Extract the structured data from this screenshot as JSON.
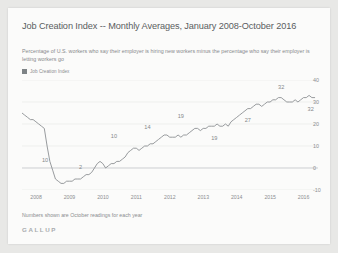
{
  "chart_data": {
    "type": "line",
    "title": "Job Creation Index -- Monthly Averages, January 2008-October 2016",
    "subtitle": "Percentage of U.S. workers who say their employer is hiring new workers minus the percentage who say their employer is letting workers go",
    "xlabel": "",
    "ylabel": "",
    "ylim": [
      -10,
      40
    ],
    "yticks": [
      40,
      30,
      20,
      10,
      0,
      -10
    ],
    "xticks": [
      "2008",
      "2009",
      "2010",
      "2011",
      "2012",
      "2013",
      "2014",
      "2015",
      "2016"
    ],
    "grid": true,
    "legend": {
      "position": "top-left",
      "entries": [
        "Job Creation Index"
      ]
    },
    "series": [
      {
        "name": "Job Creation Index",
        "color": "#8c9093",
        "x": [
          2008.0,
          2008.083,
          2008.167,
          2008.25,
          2008.333,
          2008.417,
          2008.5,
          2008.583,
          2008.667,
          2008.75,
          2008.833,
          2008.917,
          2009.0,
          2009.083,
          2009.167,
          2009.25,
          2009.333,
          2009.417,
          2009.5,
          2009.583,
          2009.667,
          2009.75,
          2009.833,
          2009.917,
          2010.0,
          2010.083,
          2010.167,
          2010.25,
          2010.333,
          2010.417,
          2010.5,
          2010.583,
          2010.667,
          2010.75,
          2010.833,
          2010.917,
          2011.0,
          2011.083,
          2011.167,
          2011.25,
          2011.333,
          2011.417,
          2011.5,
          2011.583,
          2011.667,
          2011.75,
          2011.833,
          2011.917,
          2012.0,
          2012.083,
          2012.167,
          2012.25,
          2012.333,
          2012.417,
          2012.5,
          2012.583,
          2012.667,
          2012.75,
          2012.833,
          2012.917,
          2013.0,
          2013.083,
          2013.167,
          2013.25,
          2013.333,
          2013.417,
          2013.5,
          2013.583,
          2013.667,
          2013.75,
          2013.833,
          2013.917,
          2014.0,
          2014.083,
          2014.167,
          2014.25,
          2014.333,
          2014.417,
          2014.5,
          2014.583,
          2014.667,
          2014.75,
          2014.833,
          2014.917,
          2015.0,
          2015.083,
          2015.167,
          2015.25,
          2015.333,
          2015.417,
          2015.5,
          2015.583,
          2015.667,
          2015.75,
          2015.833,
          2015.917,
          2016.0,
          2016.083,
          2016.167,
          2016.25,
          2016.333,
          2016.417,
          2016.5,
          2016.583,
          2016.667,
          2016.75
        ],
        "values": [
          25,
          24,
          23,
          22,
          22,
          21,
          20,
          19,
          18,
          10,
          3,
          -1,
          -5,
          -6,
          -7,
          -7,
          -6,
          -6,
          -6,
          -5,
          -5,
          -5,
          -4,
          -3,
          -3,
          -2,
          0,
          2,
          3,
          2,
          0,
          1,
          2,
          2,
          3,
          3,
          4,
          5,
          7,
          8,
          9,
          9,
          8,
          9,
          10,
          10,
          11,
          11,
          12,
          13,
          14,
          15,
          15,
          14,
          14,
          14,
          15,
          14,
          15,
          15,
          16,
          17,
          18,
          18,
          17,
          18,
          18,
          19,
          19,
          19,
          20,
          19,
          19,
          20,
          19,
          21,
          22,
          23,
          24,
          25,
          26,
          27,
          27,
          28,
          29,
          29,
          28,
          29,
          30,
          30,
          31,
          31,
          32,
          32,
          31,
          30,
          30,
          30,
          31,
          30,
          31,
          32,
          32,
          33,
          32,
          32
        ]
      }
    ],
    "annotations": [
      {
        "text": "10",
        "x": 2008.75,
        "y": 10,
        "label_dx": -2,
        "label_dy": 14
      },
      {
        "text": "2",
        "x": 2009.75,
        "y": -5,
        "label_dx": 0,
        "label_dy": -12
      },
      {
        "text": "10",
        "x": 2010.75,
        "y": 10,
        "label_dx": 0,
        "label_dy": -10
      },
      {
        "text": "14",
        "x": 2011.75,
        "y": 14,
        "label_dx": 0,
        "label_dy": -10
      },
      {
        "text": "19",
        "x": 2012.75,
        "y": 19,
        "label_dx": 0,
        "label_dy": -10
      },
      {
        "text": "19",
        "x": 2013.75,
        "y": 19,
        "label_dx": 0,
        "label_dy": 12
      },
      {
        "text": "27",
        "x": 2014.75,
        "y": 27,
        "label_dx": 0,
        "label_dy": 11
      },
      {
        "text": "32",
        "x": 2015.75,
        "y": 32,
        "label_dx": 0,
        "label_dy": -11
      },
      {
        "text": "32",
        "x": 2016.75,
        "y": 32,
        "label_dx": -4,
        "label_dy": 11
      }
    ],
    "footnote": "Numbers shown are October readings for each year"
  },
  "brand": {
    "name": "GALLUP"
  }
}
